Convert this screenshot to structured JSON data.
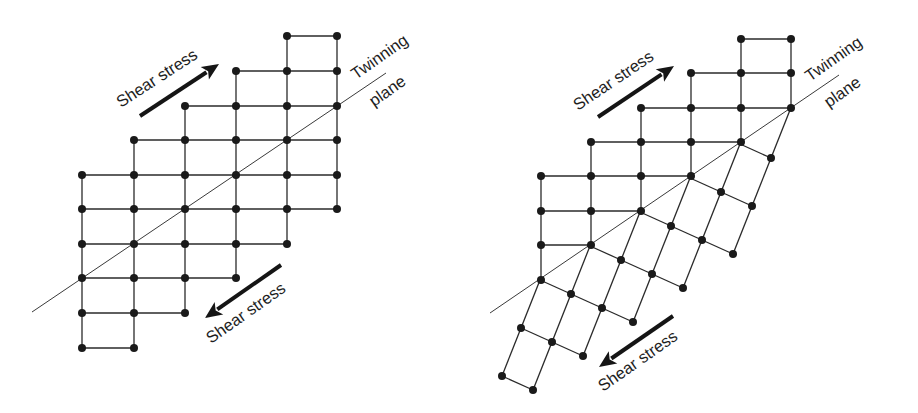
{
  "labels": {
    "shear_stress": "Shear stress",
    "twinning": "Twinning",
    "plane": "plane"
  },
  "colors": {
    "ink": "#1a1a1a",
    "background": "#ffffff"
  },
  "panels": [
    {
      "name": "before-twinning",
      "grid": {
        "cols_x": [
          82,
          134,
          185,
          236,
          287,
          337
        ],
        "rows_y": [
          36,
          71,
          106,
          140,
          175,
          209,
          244,
          278,
          313,
          348
        ],
        "row_spans": [
          [
            4,
            5
          ],
          [
            3,
            5
          ],
          [
            2,
            5
          ],
          [
            1,
            5
          ],
          [
            0,
            5
          ],
          [
            0,
            5
          ],
          [
            0,
            4
          ],
          [
            0,
            3
          ],
          [
            0,
            2
          ],
          [
            0,
            1
          ]
        ]
      },
      "twinning_plane": {
        "x1": 32,
        "y1": 312,
        "x2": 386,
        "y2": 73
      },
      "arrows": [
        {
          "name": "shear-arrow-top",
          "x1": 140,
          "y1": 116,
          "x2": 219,
          "y2": 64
        },
        {
          "name": "shear-arrow-bottom",
          "x1": 281,
          "y1": 265,
          "x2": 205,
          "y2": 318
        }
      ]
    },
    {
      "name": "after-twinning",
      "grid": {
        "cols_x": [
          541,
          591,
          641,
          691,
          741,
          791
        ],
        "rows_y": [
          39,
          73,
          108,
          142,
          176,
          211,
          245,
          280
        ],
        "row_spans": [
          [
            4,
            5
          ],
          [
            3,
            5
          ],
          [
            2,
            5
          ],
          [
            1,
            4
          ],
          [
            0,
            3
          ],
          [
            0,
            2
          ],
          [
            0,
            1
          ],
          [
            0,
            0
          ]
        ],
        "col_spans": [
          [
            4,
            7
          ],
          [
            3,
            6
          ],
          [
            2,
            5
          ],
          [
            1,
            4
          ],
          [
            0,
            3
          ],
          [
            0,
            2
          ]
        ]
      },
      "twin": {
        "origin": [
          540,
          280
        ],
        "r": [
          31,
          14
        ],
        "c": [
          -19,
          48
        ],
        "row_spans": {
          "-5": [
            5,
            5
          ],
          "-4": [
            4,
            5
          ],
          "-3": [
            3,
            5
          ],
          "-2": [
            2,
            5
          ],
          "-1": [
            1,
            4
          ],
          "0": [
            0,
            3
          ],
          "1": [
            0,
            2
          ],
          "2": [
            0,
            1
          ]
        }
      },
      "twinning_plane": {
        "x1": 490,
        "y1": 313,
        "x2": 839,
        "y2": 75
      },
      "arrows": [
        {
          "name": "shear-arrow-top",
          "x1": 598,
          "y1": 117,
          "x2": 674,
          "y2": 66
        },
        {
          "name": "shear-arrow-bottom",
          "x1": 673,
          "y1": 316,
          "x2": 599,
          "y2": 367
        }
      ]
    }
  ]
}
